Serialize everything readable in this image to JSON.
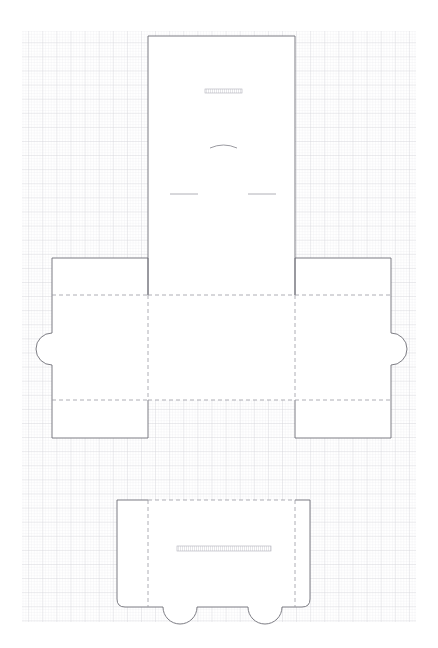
{
  "document": {
    "type": "packaging-dieline",
    "title": "Carton Dieline Cut Template",
    "canvas_width": 438,
    "canvas_height": 648,
    "background_color": "#ffffff"
  },
  "grid": {
    "name": "graph-paper-grid",
    "x": 22,
    "y": 31,
    "width": 394,
    "height": 591,
    "minor_spacing": 2.82,
    "major_every": 5,
    "minor_color": "#e9e9ec",
    "major_color": "#d2d2d8",
    "minor_width": 0.5,
    "major_width": 0.7
  },
  "styles": {
    "cut_color": "#6e6e76",
    "cut_width": 0.9,
    "fold_color": "#9a9aa2",
    "fold_width": 0.8,
    "fold_dash": "4,3",
    "perf_color": "#a8a8b0",
    "hatch_color": "#b4b4bc",
    "panel_fill": "#ffffff"
  },
  "panels": [
    {
      "id": "top-panel",
      "label": "Top Lid Panel",
      "x": 148,
      "y": 36,
      "width": 147,
      "height": 259
    },
    {
      "id": "center-panel",
      "label": "Base Panel",
      "x": 148,
      "y": 295,
      "width": 147,
      "height": 105
    },
    {
      "id": "left-flap",
      "label": "Left Side Flap",
      "x": 52,
      "y": 258,
      "width": 96,
      "height": 180
    },
    {
      "id": "right-flap",
      "label": "Right Side Flap",
      "x": 295,
      "y": 258,
      "width": 96,
      "height": 180
    },
    {
      "id": "bottom-panel",
      "label": "Bottom Closure Panel",
      "x": 117,
      "y": 500,
      "width": 193,
      "height": 107
    }
  ],
  "fold_lines": [
    {
      "id": "fold-top-horizontal",
      "label": "Top Fold Crease",
      "x1": 148,
      "y1": 295,
      "x2": 295,
      "y2": 295
    },
    {
      "id": "fold-bottom-horizontal",
      "label": "Bottom Fold Crease",
      "x1": 148,
      "y1": 400,
      "x2": 295,
      "y2": 400
    },
    {
      "id": "fold-left-flap-top",
      "label": "Left Flap Upper Crease",
      "x1": 52,
      "y1": 295,
      "x2": 148,
      "y2": 295
    },
    {
      "id": "fold-left-flap-bottom",
      "label": "Left Flap Lower Crease",
      "x1": 52,
      "y1": 400,
      "x2": 148,
      "y2": 400
    },
    {
      "id": "fold-right-flap-top",
      "label": "Right Flap Upper Crease",
      "x1": 295,
      "y1": 295,
      "x2": 391,
      "y2": 295
    },
    {
      "id": "fold-right-flap-bottom",
      "label": "Right Flap Lower Crease",
      "x1": 295,
      "y1": 400,
      "x2": 391,
      "y2": 400
    },
    {
      "id": "fold-vertical-left",
      "label": "Left Vertical Crease",
      "x1": 148,
      "y1": 295,
      "x2": 148,
      "y2": 400
    },
    {
      "id": "fold-vertical-right",
      "label": "Right Vertical Crease",
      "x1": 295,
      "y1": 295,
      "x2": 295,
      "y2": 400
    },
    {
      "id": "fold-bottom-left-vertical",
      "label": "Bottom Panel Left Crease",
      "x1": 148,
      "y1": 500,
      "x2": 148,
      "y2": 607
    },
    {
      "id": "fold-bottom-right-vertical",
      "label": "Bottom Panel Right Crease",
      "x1": 295,
      "y1": 500,
      "x2": 295,
      "y2": 607
    },
    {
      "id": "fold-bottom-attach",
      "label": "Bottom Panel Attach Crease",
      "x1": 148,
      "y1": 500,
      "x2": 295,
      "y2": 500
    }
  ],
  "tabs": [
    {
      "id": "left-thumb-notch",
      "label": "Left Thumb Notch",
      "cx": 52,
      "cy": 349,
      "radius": 16,
      "side": "left"
    },
    {
      "id": "right-thumb-notch",
      "label": "Right Thumb Notch",
      "cx": 391,
      "cy": 349,
      "radius": 16,
      "side": "right"
    },
    {
      "id": "bottom-lock-tab-left",
      "label": "Bottom Lock Tab Left",
      "cx": 180,
      "cy": 607,
      "radius": 17,
      "side": "bottom"
    },
    {
      "id": "bottom-lock-tab-right",
      "label": "Bottom Lock Tab Right",
      "cx": 265,
      "cy": 607,
      "radius": 17,
      "side": "bottom"
    }
  ],
  "marks": [
    {
      "id": "top-panel-hatch-slot",
      "label": "Upper Hatched Slot",
      "type": "hatched-bar",
      "x": 205,
      "y": 89,
      "width": 37,
      "height": 4
    },
    {
      "id": "top-panel-arc-score",
      "label": "Arc Score Line",
      "type": "arc",
      "x1": 210,
      "y1": 146,
      "x2": 237,
      "y2": 146,
      "bulge": 4
    },
    {
      "id": "top-panel-score-left",
      "label": "Left Score Line",
      "type": "line",
      "x1": 170,
      "y1": 194,
      "x2": 198,
      "y2": 194
    },
    {
      "id": "top-panel-score-right",
      "label": "Right Score Line",
      "type": "line",
      "x1": 248,
      "y1": 194,
      "x2": 276,
      "y2": 194
    },
    {
      "id": "bottom-panel-hatch-slot",
      "label": "Bottom Hatched Lock Slot",
      "type": "hatched-bar",
      "x": 177,
      "y": 546,
      "width": 94,
      "height": 5
    }
  ]
}
